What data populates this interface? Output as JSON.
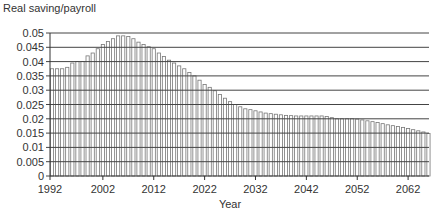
{
  "chart_data": {
    "type": "bar",
    "title": "",
    "ylabel": "Real saving/payroll",
    "xlabel": "Year",
    "ylim": [
      0,
      0.05
    ],
    "yticks": [
      "0",
      "0.005",
      "0.01",
      "0.015",
      "0.02",
      "0.025",
      "0.03",
      "0.035",
      "0.04",
      "0.045",
      "0.05"
    ],
    "xticks": [
      "1992",
      "2002",
      "2012",
      "2022",
      "2032",
      "2042",
      "2052",
      "2062"
    ],
    "grid": "horizontal",
    "legend": null,
    "x": [
      1992,
      1993,
      1994,
      1995,
      1996,
      1997,
      1998,
      1999,
      2000,
      2001,
      2002,
      2003,
      2004,
      2005,
      2006,
      2007,
      2008,
      2009,
      2010,
      2011,
      2012,
      2013,
      2014,
      2015,
      2016,
      2017,
      2018,
      2019,
      2020,
      2021,
      2022,
      2023,
      2024,
      2025,
      2026,
      2027,
      2028,
      2029,
      2030,
      2031,
      2032,
      2033,
      2034,
      2035,
      2036,
      2037,
      2038,
      2039,
      2040,
      2041,
      2042,
      2043,
      2044,
      2045,
      2046,
      2047,
      2048,
      2049,
      2050,
      2051,
      2052,
      2053,
      2054,
      2055,
      2056,
      2057,
      2058,
      2059,
      2060,
      2061,
      2062,
      2063,
      2064,
      2065,
      2066
    ],
    "values": [
      0.0375,
      0.0375,
      0.0375,
      0.038,
      0.0395,
      0.04,
      0.04,
      0.042,
      0.043,
      0.0445,
      0.046,
      0.047,
      0.048,
      0.049,
      0.049,
      0.0488,
      0.048,
      0.0468,
      0.046,
      0.0452,
      0.0445,
      0.043,
      0.0418,
      0.0405,
      0.0395,
      0.0385,
      0.0375,
      0.0362,
      0.035,
      0.0335,
      0.032,
      0.031,
      0.0298,
      0.0285,
      0.0272,
      0.026,
      0.025,
      0.0242,
      0.0235,
      0.0232,
      0.0228,
      0.0224,
      0.022,
      0.0218,
      0.0216,
      0.0214,
      0.0212,
      0.0211,
      0.021,
      0.021,
      0.021,
      0.021,
      0.021,
      0.021,
      0.0208,
      0.0204,
      0.02,
      0.02,
      0.02,
      0.02,
      0.0199,
      0.0196,
      0.0193,
      0.019,
      0.0187,
      0.0183,
      0.0179,
      0.0176,
      0.0173,
      0.017,
      0.0166,
      0.0162,
      0.0158,
      0.0154,
      0.0149
    ]
  }
}
